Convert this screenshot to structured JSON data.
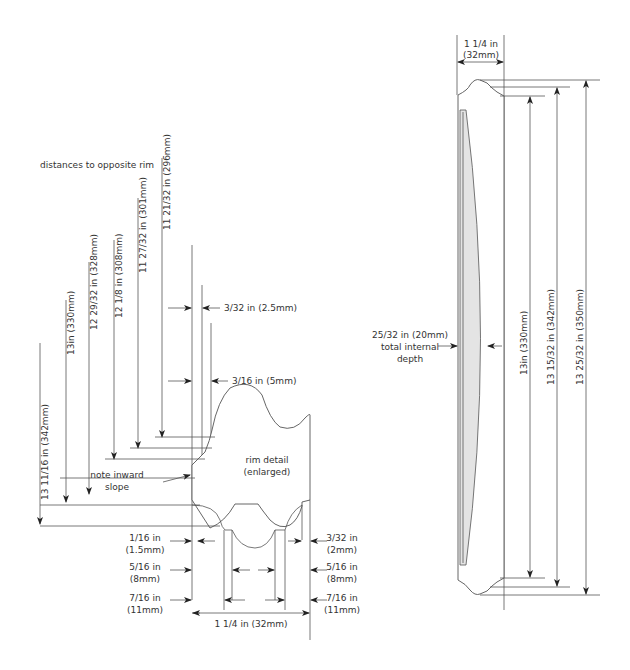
{
  "left_panel": {
    "heading": "distances to opposite rim",
    "distances": [
      {
        "label": "13 11/16 in (342mm)",
        "x": 40
      },
      {
        "label": "13in (330mm)",
        "x": 66
      },
      {
        "label": "12 29/32 in (328mm)",
        "x": 89
      },
      {
        "label": "12 1/8 in (308mm)",
        "x": 114
      },
      {
        "label": "11 27/32 in (301mm)",
        "x": 138
      },
      {
        "label": "11 21/32 in (296mm)",
        "x": 162
      }
    ],
    "top_dims": [
      {
        "label": "3/32 in (2.5mm)"
      },
      {
        "label": "3/16 in (5mm)"
      }
    ],
    "note": [
      "note inward",
      "slope"
    ],
    "rim_detail": [
      "rim detail",
      "(enlarged)"
    ],
    "bottom_left_dims": [
      {
        "in": "1/16 in",
        "mm": "(1.5mm)"
      },
      {
        "in": "5/16 in",
        "mm": "(8mm)"
      },
      {
        "in": "7/16 in",
        "mm": "(11mm)"
      }
    ],
    "bottom_right_dims": [
      {
        "in": "3/32 in",
        "mm": "(2mm)"
      },
      {
        "in": "5/16 in",
        "mm": "(8mm)"
      },
      {
        "in": "7/16 in",
        "mm": "(11mm)"
      }
    ],
    "width_dim": "1 1/4 in (32mm)"
  },
  "right_panel": {
    "width_dim": [
      "1 1/4 in",
      "(32mm)"
    ],
    "depth_dim": [
      "25/32 in (20mm)",
      "total internal",
      "depth"
    ],
    "heights": [
      {
        "label": "13in (330mm)"
      },
      {
        "label": "13 15/32 in (342mm)"
      },
      {
        "label": "13 25/32 in (350mm)"
      }
    ]
  },
  "colors": {
    "line": "#555555",
    "text": "#333333",
    "fill": "#e4e4e4"
  }
}
